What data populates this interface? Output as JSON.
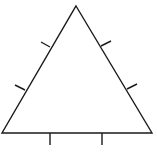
{
  "diagram": {
    "type": "equilateral-triangle",
    "stroke_color": "#1a1a1a",
    "background": "#ffffff",
    "vertices": {
      "apex": [
        76,
        6
      ],
      "bottom_left": [
        2,
        133
      ],
      "bottom_right": [
        152,
        133
      ]
    },
    "tick_marks_per_side": 2,
    "ticks": {
      "left_side": [
        [
          [
            50,
            47
          ],
          [
            41,
            42
          ]
        ],
        [
          [
            25,
            90
          ],
          [
            15,
            85
          ]
        ]
      ],
      "right_side": [
        [
          [
            101,
            46
          ],
          [
            111,
            41
          ]
        ],
        [
          [
            127,
            89
          ],
          [
            137,
            84
          ]
        ]
      ],
      "base": [
        [
          [
            50,
            133
          ],
          [
            50,
            145
          ]
        ],
        [
          [
            102,
            133
          ],
          [
            102,
            145
          ]
        ]
      ]
    }
  }
}
